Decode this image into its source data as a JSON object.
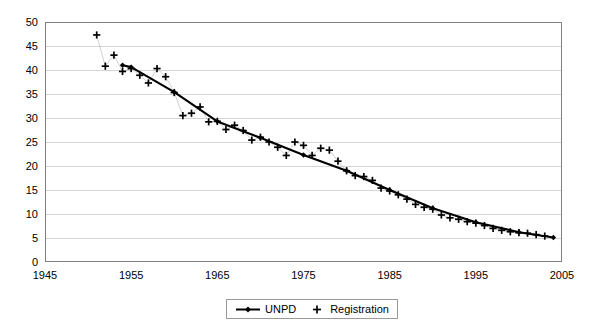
{
  "chart_data": {
    "type": "line",
    "title": "",
    "subtitle": "",
    "xlabel": "",
    "ylabel": "",
    "xlim": [
      1945,
      2005
    ],
    "ylim": [
      0,
      50
    ],
    "xticks": [
      1945,
      1955,
      1965,
      1975,
      1985,
      1995,
      2005
    ],
    "yticks": [
      0,
      5,
      10,
      15,
      20,
      25,
      30,
      35,
      40,
      45,
      50
    ],
    "grid": "horizontal",
    "legend_position": "bottom-center",
    "series": [
      {
        "name": "UNPD",
        "marker": "diamond",
        "line": "solid",
        "color": "#000000",
        "x": [
          1954,
          1955,
          1960,
          1965,
          1970,
          1975,
          1980,
          1985,
          1990,
          1995,
          2000,
          2004
        ],
        "values": [
          41.0,
          40.6,
          35.4,
          29.3,
          25.9,
          22.3,
          19.0,
          15.0,
          11.2,
          8.3,
          6.2,
          5.1
        ]
      },
      {
        "name": "Registration",
        "marker": "plus",
        "line": "none",
        "color": "#000000",
        "x": [
          1951,
          1952,
          1953,
          1954,
          1955,
          1956,
          1957,
          1958,
          1959,
          1960,
          1961,
          1962,
          1963,
          1964,
          1965,
          1966,
          1967,
          1968,
          1969,
          1970,
          1971,
          1972,
          1973,
          1974,
          1975,
          1976,
          1977,
          1978,
          1979,
          1980,
          1981,
          1982,
          1983,
          1984,
          1985,
          1986,
          1987,
          1988,
          1989,
          1990,
          1991,
          1992,
          1993,
          1994,
          1995,
          1996,
          1997,
          1998,
          1999,
          2000,
          2001,
          2002,
          2003
        ],
        "values": [
          47.3,
          40.8,
          43.1,
          39.7,
          40.3,
          38.9,
          37.3,
          40.3,
          38.6,
          35.3,
          30.5,
          31.0,
          32.3,
          29.2,
          29.3,
          27.6,
          28.5,
          27.4,
          25.4,
          26.0,
          25.0,
          23.9,
          22.2,
          25.0,
          24.3,
          22.2,
          23.7,
          23.3,
          21.0,
          19.0,
          18.0,
          17.8,
          17.0,
          15.4,
          14.8,
          14.0,
          13.1,
          12.0,
          11.4,
          11.0,
          9.8,
          9.2,
          8.9,
          8.4,
          8.1,
          7.6,
          7.0,
          6.6,
          6.3,
          6.1,
          6.0,
          5.7,
          5.4
        ]
      }
    ],
    "x_tick_labels": [
      "1945",
      "1955",
      "1965",
      "1975",
      "1985",
      "1995",
      "2005"
    ],
    "y_tick_labels": [
      "0",
      "5",
      "10",
      "15",
      "20",
      "25",
      "30",
      "35",
      "40",
      "45",
      "50"
    ]
  },
  "legend": {
    "items": [
      {
        "label": "UNPD",
        "marker": "diamond-line"
      },
      {
        "label": "Registration",
        "marker": "plus"
      }
    ]
  },
  "colors": {
    "series": "#000000",
    "gridline": "#d4d4d4",
    "axis": "#808080",
    "background": "#ffffff"
  }
}
